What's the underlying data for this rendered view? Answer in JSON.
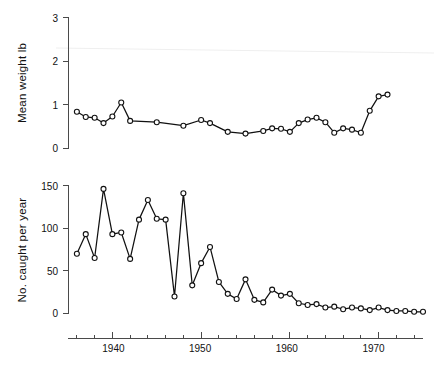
{
  "figure": {
    "background": "#ffffff",
    "line_color": "#111111",
    "marker_fill": "#ffffff",
    "axis_color": "#4a4a4a"
  },
  "chart_data": [
    {
      "type": "line",
      "panel": "top",
      "title": "",
      "xlabel": "",
      "ylabel": "Mean weight lb",
      "ylim": [
        0,
        3
      ],
      "xlim": [
        1935,
        1975
      ],
      "yticks": [
        0,
        1,
        2,
        3
      ],
      "ytick_labels": [
        "0",
        "1",
        "2",
        "3"
      ],
      "xticks": [
        1940,
        1950,
        1960,
        1970
      ],
      "xtick_labels": [
        "1940",
        "1950",
        "1960",
        "1970"
      ],
      "grid": false,
      "legend": "none",
      "marker": "open-circle",
      "x": [
        1936,
        1937,
        1938,
        1939,
        1940,
        1941,
        1942,
        1945,
        1948,
        1950,
        1951,
        1953,
        1955,
        1957,
        1958,
        1959,
        1960,
        1961,
        1962,
        1963,
        1964,
        1965,
        1966,
        1967,
        1968,
        1969,
        1970,
        1971
      ],
      "values": [
        0.84,
        0.72,
        0.7,
        0.58,
        0.73,
        1.05,
        0.63,
        0.6,
        0.52,
        0.65,
        0.58,
        0.38,
        0.34,
        0.4,
        0.46,
        0.45,
        0.38,
        0.58,
        0.66,
        0.7,
        0.6,
        0.36,
        0.46,
        0.43,
        0.36,
        0.86,
        1.19,
        1.23,
        1.8
      ]
    },
    {
      "type": "line",
      "panel": "bottom",
      "title": "",
      "xlabel": "",
      "ylabel": "No. caught per year",
      "ylim": [
        0,
        150
      ],
      "xlim": [
        1935,
        1975
      ],
      "yticks": [
        0,
        50,
        100,
        150
      ],
      "ytick_labels": [
        "0",
        "50",
        "100",
        "150"
      ],
      "xticks": [
        1940,
        1950,
        1960,
        1970
      ],
      "xtick_labels": [
        "1940",
        "1950",
        "1960",
        "1970"
      ],
      "grid": false,
      "legend": "none",
      "marker": "open-circle",
      "x": [
        1936,
        1937,
        1938,
        1939,
        1940,
        1941,
        1942,
        1943,
        1944,
        1945,
        1946,
        1947,
        1948,
        1949,
        1950,
        1951,
        1952,
        1953,
        1954,
        1955,
        1956,
        1957,
        1958,
        1959,
        1960,
        1961,
        1962,
        1963,
        1964,
        1965,
        1966,
        1967,
        1968,
        1969,
        1970,
        1971,
        1972,
        1973,
        1974,
        1975
      ],
      "values": [
        70,
        93,
        65,
        146,
        93,
        95,
        64,
        110,
        133,
        111,
        110,
        20,
        141,
        33,
        59,
        78,
        37,
        23,
        17,
        40,
        16,
        13,
        28,
        21,
        23,
        12,
        10,
        11,
        7,
        8,
        5,
        7,
        6,
        4,
        7,
        4,
        3,
        3,
        2,
        2
      ]
    }
  ],
  "panels": {
    "top": {
      "ylabel": "Mean weight lb",
      "ytick_labels": [
        "0",
        "1",
        "2",
        "3"
      ]
    },
    "bottom": {
      "ylabel": "No. caught per year",
      "ytick_labels": [
        "0",
        "50",
        "100",
        "150"
      ]
    },
    "xaxis": {
      "tick_labels": [
        "1940",
        "1950",
        "1960",
        "1970"
      ]
    }
  }
}
